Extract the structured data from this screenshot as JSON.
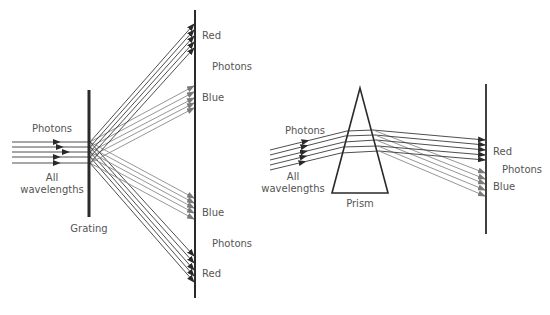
{
  "grating_diagram": {
    "incoming_label": "Photons",
    "incoming_sublabel_1": "All",
    "incoming_sublabel_2": "wavelengths",
    "element_label": "Grating",
    "upper": {
      "red_label": "Red",
      "photons_label": "Photons",
      "blue_label": "Blue"
    },
    "lower": {
      "blue_label": "Blue",
      "photons_label": "Photons",
      "red_label": "Red"
    }
  },
  "prism_diagram": {
    "incoming_label": "Photons",
    "incoming_sublabel_1": "All",
    "incoming_sublabel_2": "wavelengths",
    "element_label": "Prism",
    "red_label": "Red",
    "photons_label": "Photons",
    "blue_label": "Blue"
  },
  "colors": {
    "red_ray": "#3a3a3a",
    "blue_ray": "#8a8a8a",
    "label": "#555555"
  }
}
